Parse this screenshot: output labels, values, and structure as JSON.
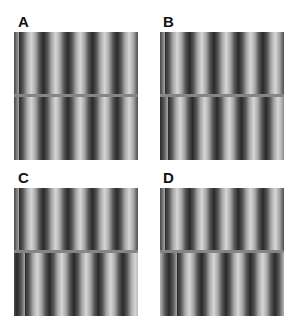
{
  "figure": {
    "panels": [
      {
        "label": "A",
        "phase_shift_px": 0
      },
      {
        "label": "B",
        "phase_shift_px": 3
      },
      {
        "label": "C",
        "phase_shift_px": 6
      },
      {
        "label": "D",
        "phase_shift_px": 12
      }
    ],
    "grating": {
      "period_px": 24.5,
      "orientation": "vertical",
      "dark": "#2a2a2a",
      "light": "#d6d6d6",
      "divider_color": "#858585"
    }
  }
}
